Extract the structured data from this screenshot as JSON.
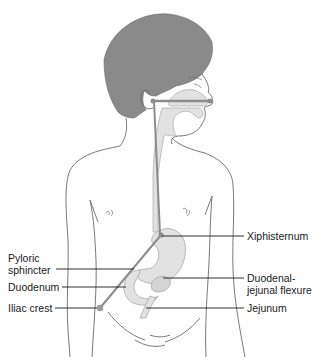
{
  "diagram": {
    "colors": {
      "hair": "#8a8a8a",
      "outline": "#6a6a6a",
      "organ_fill": "#e2e2e2",
      "tube": "#8c8c8c",
      "label_text": "#1a1a1a",
      "leader_line": "#1a1a1a"
    },
    "labels": {
      "xiphisternum": "Xiphisternum",
      "pyloric_line1": "Pyloric",
      "pyloric_line2": "sphincter",
      "duodenum": "Duodenum",
      "duodenal_line1": "Duodenal-",
      "duodenal_line2": "jejunal flexure",
      "iliac_crest": "Iliac crest",
      "jejunum": "Jejunum"
    }
  }
}
